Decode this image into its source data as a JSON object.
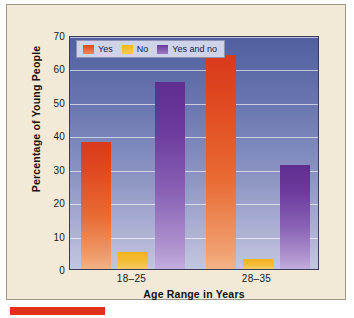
{
  "chart_data": {
    "type": "bar",
    "title": "",
    "xlabel": "Age Range in Years",
    "ylabel": "Percentage of Young People",
    "categories": [
      "18–25",
      "28–35"
    ],
    "series": [
      {
        "name": "Yes",
        "color": "#e4431f",
        "values": [
          38,
          64
        ]
      },
      {
        "name": "No",
        "color": "#f3b61e",
        "values": [
          5,
          3
        ]
      },
      {
        "name": "Yes and no",
        "color": "#6b3a9c",
        "values": [
          56,
          31
        ]
      }
    ],
    "ylim": [
      0,
      70
    ],
    "yticks": [
      0,
      10,
      20,
      30,
      40,
      50,
      60,
      70
    ],
    "ytick_labels": [
      "0",
      "10",
      "20",
      "30",
      "40",
      "50",
      "60",
      "70"
    ],
    "grid": true,
    "legend_position": "top-left",
    "plot_background": "#6b77b0"
  },
  "accent": {
    "color": "#e23119"
  },
  "card": {
    "background": "#f2ead6"
  }
}
